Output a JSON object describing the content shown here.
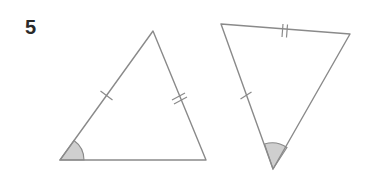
{
  "problem": {
    "number": "5",
    "description": "Two triangles with congruence markings: one side with single tick, one side with double tick, and a marked included angle"
  },
  "figures": [
    {
      "name": "triangle-left",
      "vertices": [
        [
          60,
          160
        ],
        [
          153,
          31
        ],
        [
          206,
          160
        ]
      ],
      "single_tick_side": "bottom-left to apex",
      "double_tick_side": "apex to bottom-right",
      "marked_angle_vertex": "bottom-left"
    },
    {
      "name": "triangle-right",
      "vertices": [
        [
          221,
          24
        ],
        [
          350,
          34
        ],
        [
          273,
          169
        ]
      ],
      "single_tick_side": "top-left to bottom",
      "double_tick_side": "top-left to top-right",
      "marked_angle_vertex": "bottom"
    }
  ],
  "colors": {
    "stroke": "#8a8a8a",
    "angle_fill": "#cfcfcf",
    "label": "#2a2a2a"
  }
}
